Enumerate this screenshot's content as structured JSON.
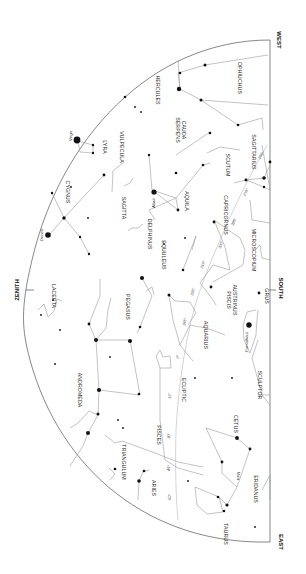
{
  "chart": {
    "kind": "star-map",
    "orientation": "rotated 90° clockwise, horizon on right",
    "colors": {
      "background": "#ffffff",
      "stars": "#111111",
      "lines": "#9a9a9a",
      "horizon": "#555555"
    }
  },
  "directions": {
    "zenith": "ZENITH",
    "west": "WEST",
    "south": "SOUTH",
    "east": "EAST"
  },
  "constellations": {
    "hercules": "HERCULES",
    "ophiuchus": "OPHIUCHUS",
    "serpens_cauda_1": "SERPENS",
    "serpens_cauda_2": "CAUDA",
    "lyra": "LYRA",
    "vulpecula": "VULPECULA",
    "scutum": "SCUTUM",
    "sagittarius": "SAGITTARIUS",
    "cygnus": "CYGNUS",
    "sagitta": "SAGITTA",
    "aquila": "AQUILA",
    "delphinus": "DELPHINUS",
    "capricornus": "CAPRICORNUS",
    "equuleus": "EQUULEUS",
    "microscopium": "MICROSCOPIUM",
    "lacerta": "LACERTA",
    "pegasus": "PEGASUS",
    "piscis_austrinus_1": "PISCIS",
    "piscis_austrinus_2": "AUSTRINUS",
    "grus": "GRUS",
    "aquarius": "AQUARIUS",
    "andromeda": "ANDROMEDA",
    "ecliptic": "ECLIPTIC",
    "pisces": "PISCES",
    "cetus": "CETUS",
    "sculptor": "SCULPTOR",
    "triangulum": "TRIANGULUM",
    "aries": "ARIES",
    "eridanus": "ERIDANUS",
    "taurus": "TAURUS"
  },
  "stars": {
    "vega": "Vega",
    "deneb": "Deneb",
    "altair": "Altair",
    "fomalhaut": "Fomalhaut",
    "mira": "Mira"
  },
  "ecliptic_marks": [
    "270°",
    "300°",
    "330°",
    "0°",
    "30°",
    "60°",
    "240°",
    "255°",
    "285°",
    "315°",
    "345°",
    "15°",
    "45°"
  ]
}
